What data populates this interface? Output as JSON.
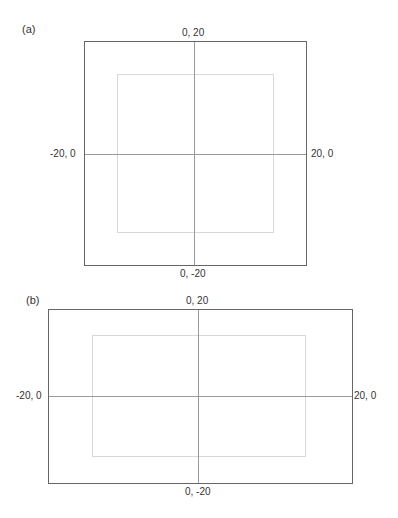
{
  "panels": [
    {
      "label": "(a)",
      "top_label": "0, 20",
      "bottom_label": "0, -20",
      "left_label": "-20, 0",
      "right_label": "20, 0"
    },
    {
      "label": "(b)",
      "top_label": "0, 20",
      "bottom_label": "0, -20",
      "left_label": "-20, 0",
      "right_label": "20, 0"
    }
  ],
  "colors": {
    "outer_border": "#666666",
    "inner_border": "#d8d8d8",
    "axis_lines": "#9a9a9a",
    "text": "#333333"
  }
}
